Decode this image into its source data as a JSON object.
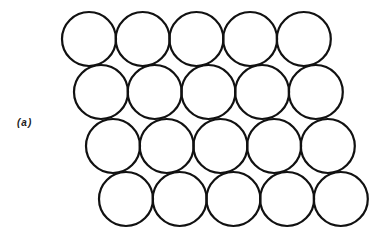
{
  "figure": {
    "label": "(a)",
    "stroke_color": "#111111",
    "background": "#ffffff",
    "radius": 27,
    "spacing_x": 53.7,
    "rows": [
      {
        "y": 39,
        "x_start": 89,
        "count": 5
      },
      {
        "y": 92,
        "x_start": 101,
        "count": 5
      },
      {
        "y": 146,
        "x_start": 113,
        "count": 5
      },
      {
        "y": 199,
        "x_start": 126,
        "count": 5
      }
    ]
  }
}
